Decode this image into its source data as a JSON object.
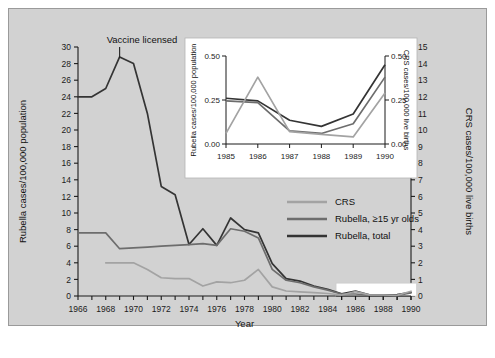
{
  "figure": {
    "background": "#d2d2d2",
    "frame_border": "#9a9a9a",
    "annotation": "Vaccine licensed"
  },
  "colors": {
    "total": "#343434",
    "older": "#6d6d6d",
    "crs": "#a3a3a3",
    "axis": "#1b1b1b",
    "inset_bg": "#ffffff"
  },
  "legend": {
    "items": [
      {
        "label": "CRS",
        "color": "#a3a3a3"
      },
      {
        "label": "Rubella, ≥15 yr olds",
        "color": "#6d6d6d"
      },
      {
        "label": "Rubella, total",
        "color": "#343434"
      }
    ]
  },
  "chart_data": {
    "type": "line",
    "title": "",
    "xlabel": "Year",
    "ylabel": "Rubella cases/100,000 population",
    "y2label": "CRS cases/100,000 live births",
    "xlim": [
      1966,
      1990
    ],
    "ylim": [
      0,
      30
    ],
    "y2lim": [
      0,
      15
    ],
    "grid": false,
    "legend_position": "center-right",
    "x": [
      1966,
      1967,
      1968,
      1969,
      1970,
      1971,
      1972,
      1973,
      1974,
      1975,
      1976,
      1977,
      1978,
      1979,
      1980,
      1981,
      1982,
      1983,
      1984,
      1985,
      1986,
      1987,
      1988,
      1989,
      1990
    ],
    "xticks": [
      1966,
      1968,
      1970,
      1972,
      1974,
      1976,
      1978,
      1980,
      1982,
      1984,
      1986,
      1988,
      1990
    ],
    "yticks": [
      0,
      2,
      4,
      6,
      8,
      10,
      12,
      14,
      16,
      18,
      20,
      22,
      24,
      26,
      28,
      30
    ],
    "y2ticks": [
      0,
      1,
      2,
      3,
      4,
      5,
      6,
      7,
      8,
      9,
      10,
      11,
      12,
      13,
      14,
      15
    ],
    "series": [
      {
        "name": "Rubella, total",
        "color": "#343434",
        "axis": "left",
        "values": [
          24.0,
          24.0,
          25.0,
          28.8,
          28.0,
          22.0,
          13.2,
          12.2,
          6.2,
          8.1,
          6.1,
          9.4,
          8.0,
          7.6,
          3.9,
          2.1,
          1.8,
          1.2,
          0.8,
          0.26,
          0.6,
          0.14,
          0.1,
          0.17,
          0.45
        ]
      },
      {
        "name": "Rubella, ≥15 yr olds",
        "color": "#6d6d6d",
        "axis": "left",
        "values": [
          7.6,
          7.6,
          7.6,
          5.7,
          5.8,
          5.9,
          6.0,
          6.1,
          6.2,
          6.3,
          6.1,
          8.1,
          7.8,
          7.0,
          3.2,
          1.9,
          1.6,
          1.1,
          0.7,
          0.245,
          0.24,
          0.1,
          0.08,
          0.06,
          0.38
        ]
      },
      {
        "name": "CRS",
        "color": "#a3a3a3",
        "axis": "right",
        "values": [
          null,
          null,
          2.0,
          2.0,
          2.0,
          1.6,
          1.1,
          1.05,
          1.05,
          0.6,
          0.85,
          0.8,
          0.95,
          1.6,
          0.55,
          0.3,
          0.25,
          0.2,
          0.15,
          0.06,
          0.26,
          0.07,
          0.06,
          0.04,
          0.29
        ]
      }
    ]
  },
  "inset": {
    "type": "line",
    "xlabel": "",
    "ylabel": "Rubella cases/100,000 population",
    "y2label": "CRS cases/100,000 live births",
    "xlim": [
      1985,
      1990
    ],
    "ylim": [
      0.0,
      0.5
    ],
    "y2lim": [
      0.0,
      0.5
    ],
    "x": [
      1985,
      1986,
      1987,
      1988,
      1989,
      1990
    ],
    "xticks": [
      1985,
      1986,
      1987,
      1988,
      1989,
      1990
    ],
    "yticks": [
      0.0,
      0.25,
      0.5
    ],
    "yticklabels": [
      "0.00",
      "0.25",
      "0.50"
    ],
    "y2ticklabels": [
      "0.00",
      "0.25",
      "0.50"
    ],
    "series": [
      {
        "name": "Rubella, total",
        "color": "#343434",
        "values": [
          0.26,
          0.245,
          0.135,
          0.1,
          0.17,
          0.45
        ]
      },
      {
        "name": "Rubella, ≥15 yr olds",
        "color": "#6d6d6d",
        "values": [
          0.245,
          0.235,
          0.075,
          0.06,
          0.115,
          0.38
        ]
      },
      {
        "name": "CRS",
        "color": "#a3a3a3",
        "values": [
          0.06,
          0.38,
          0.07,
          0.055,
          0.04,
          0.29
        ]
      }
    ]
  }
}
